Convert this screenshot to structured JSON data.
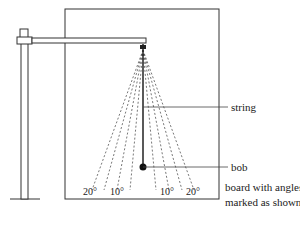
{
  "labels": {
    "string": "string",
    "bob": "bob",
    "board_line1": "board with angles",
    "board_line2": "marked as shown"
  },
  "angles": [
    "20°",
    "10°",
    "10°",
    "20°"
  ],
  "colors": {
    "line": "#333333",
    "dash": "#555555"
  }
}
